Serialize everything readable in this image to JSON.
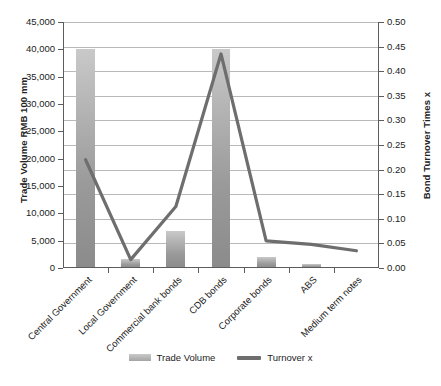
{
  "chart_data": {
    "type": "bar",
    "title": "",
    "xlabel": "",
    "ylabel": "Trade Volume RMB 100 mm",
    "y2label": "Bond Turnover Times x",
    "grid": true,
    "legend_position": "bottom",
    "categories": [
      "Central Government",
      "Local Government",
      "Commercial bank bonds",
      "CDB bonds",
      "Corporate bonds",
      "ABS",
      "Medium term notes"
    ],
    "ylim": [
      0,
      45000
    ],
    "yticks": [
      "0",
      "5,000",
      "10,000",
      "15,000",
      "20,000",
      "25,000",
      "30,000",
      "35,000",
      "40,000",
      "45,000"
    ],
    "ytick_values": [
      0,
      5000,
      10000,
      15000,
      20000,
      25000,
      30000,
      35000,
      40000,
      45000
    ],
    "y2lim": [
      0,
      0.5
    ],
    "y2ticks": [
      "0.00",
      "0.05",
      "0.10",
      "0.15",
      "0.20",
      "0.25",
      "0.30",
      "0.35",
      "0.40",
      "0.45",
      "0.50"
    ],
    "y2tick_values": [
      0,
      0.05,
      0.1,
      0.15,
      0.2,
      0.25,
      0.3,
      0.35,
      0.4,
      0.45,
      0.5
    ],
    "series": [
      {
        "name": "Trade Volume",
        "type": "bar",
        "axis": "left",
        "color": "#a8a8a8",
        "values": [
          40000,
          1700,
          6700,
          40000,
          2000,
          800,
          0
        ]
      },
      {
        "name": "Turnover x",
        "type": "line",
        "axis": "right",
        "color": "#6e6e6e",
        "values": [
          0.22,
          0.017,
          0.125,
          0.435,
          0.055,
          0.048,
          0.035
        ]
      }
    ]
  },
  "legend": {
    "items": [
      {
        "label": "Trade Volume",
        "marker": "bar-swatch"
      },
      {
        "label": "Turnover x",
        "marker": "line-swatch"
      }
    ]
  }
}
